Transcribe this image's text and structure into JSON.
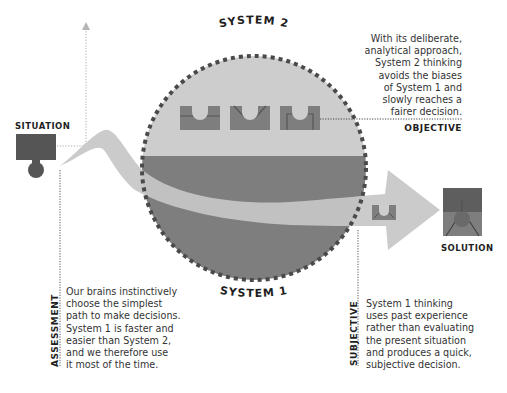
{
  "labels": {
    "system2": "SYSTEM 2",
    "system1": "SYSTEM 1",
    "situation": "SITUATION",
    "objective": "OBJECTIVE",
    "solution": "SOLUTION",
    "assessment": "ASSESSMENT",
    "subjective": "SUBJECTIVE"
  },
  "texts": {
    "system2_description": [
      "With its deliberate,",
      "analytical approach,",
      "System 2 thinking",
      "avoids the biases",
      "of System 1 and",
      "slowly reaches a",
      "fairer decision."
    ],
    "assessment_description": [
      "Our brains instinctively",
      "choose the simplest",
      "path to make decisions.",
      "System 1 is faster and",
      "easier than System 2,",
      "and we therefore use",
      "it most of the time."
    ],
    "subjective_description": [
      "System 1 thinking",
      "uses past experience",
      "rather than evaluating",
      "the present situation",
      "and produces a quick,",
      "subjective decision."
    ]
  },
  "colors": {
    "light_gray": "#cdcdcd",
    "mid_gray": "#7e7e7e",
    "dark_gray": "#555555",
    "arrow_gray": "#c4c4c4",
    "dots": "#4a4a4a",
    "text": "#2a2a2a"
  },
  "icons": {
    "situation": "puzzle-piece-icon",
    "objective_pieces": [
      "flat-slot-icon",
      "v-slot-icon",
      "square-slot-icon"
    ],
    "solution": "fitted-piece-icon"
  }
}
